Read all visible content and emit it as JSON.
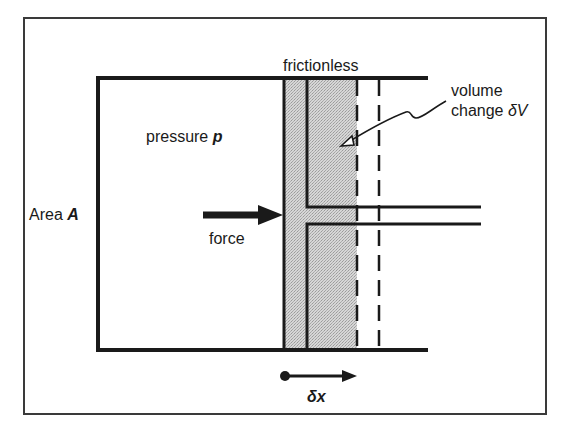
{
  "figure": {
    "labels": {
      "frictionless": "frictionless",
      "volume_line1": "volume",
      "volume_line2": "change ",
      "volume_symbol": "δV",
      "pressure_text": "pressure ",
      "pressure_symbol": "p",
      "area_text": "Area ",
      "area_symbol": "A",
      "force": "force",
      "displacement_symbol": "δx"
    },
    "colors": {
      "ink": "#1a1a1a",
      "shading": "#cfcfcf",
      "frame": "#3a3a3a",
      "background": "#ffffff"
    },
    "components": [
      "outer-frame",
      "cylinder",
      "piston",
      "piston-rod",
      "swept-volume-shading",
      "displaced-piston-dashed-outline",
      "force-arrow",
      "displacement-arrow",
      "volume-change-leader"
    ]
  }
}
